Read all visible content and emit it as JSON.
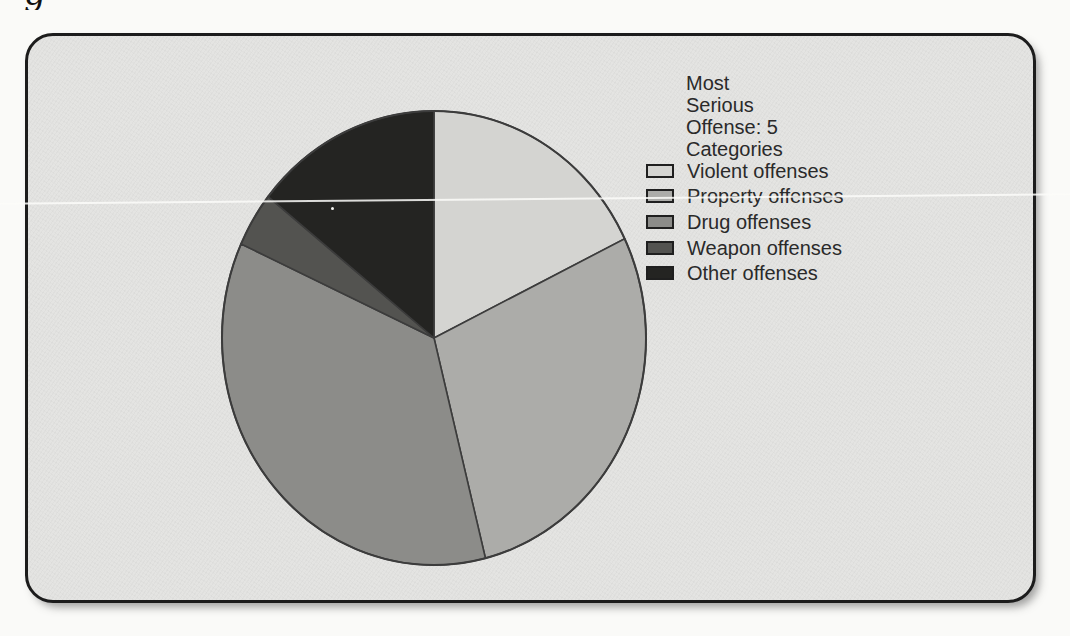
{
  "page": {
    "cropped_text_fragment": "g",
    "page_background": "#fafaf8"
  },
  "figure": {
    "box_background": "#e4e4e2",
    "box_border_color": "#1c1c1c"
  },
  "chart_data": {
    "type": "pie",
    "title": "Most Serious Offense: 5 Categories",
    "labels": [
      "Violent offenses",
      "Property offenses",
      "Drug offenses",
      "Weapon offenses",
      "Other offenses"
    ],
    "values": [
      17.8,
      28.3,
      35.7,
      3.9,
      14.3
    ],
    "colors": [
      "#d4d4d1",
      "#acaca9",
      "#8c8c89",
      "#535350",
      "#242422"
    ],
    "outline_color": "#3c3c3c",
    "start_angle_deg": 0,
    "direction": "clockwise",
    "legend_position": "right",
    "data_labels_shown": false
  }
}
